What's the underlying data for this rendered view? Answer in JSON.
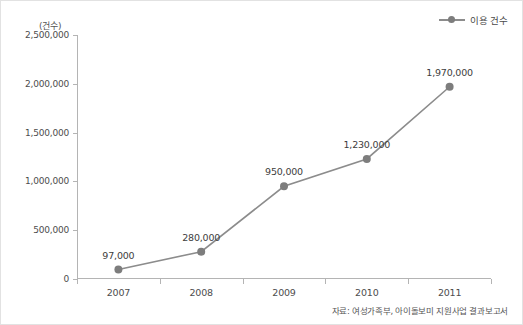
{
  "legend": {
    "label": "이용 건수",
    "symbol_icon": "line-marker-icon",
    "color": "#8c8c8c"
  },
  "axis_unit_caption": "(건수)",
  "source_note": "자료: 여성가족부, 아이돌보미 지원사업 결과보고서",
  "chart_data": {
    "type": "line",
    "title": "",
    "subtitle": "",
    "xlabel": "",
    "ylabel": "(건수)",
    "categories": [
      "2007",
      "2008",
      "2009",
      "2010",
      "2011"
    ],
    "x": [
      2007,
      2008,
      2009,
      2010,
      2011
    ],
    "series": [
      {
        "name": "이용 건수",
        "color": "#8c8c8c",
        "marker": "circle",
        "values": [
          97000,
          280000,
          950000,
          1230000,
          1970000
        ],
        "point_labels": [
          "97,000",
          "280,000",
          "950,000",
          "1,230,000",
          "1,970,000"
        ]
      }
    ],
    "ylim": [
      0,
      2500000
    ],
    "ytick_values": [
      0,
      500000,
      1000000,
      1500000,
      2000000,
      2500000
    ],
    "ytick_labels": [
      "0",
      "500,000",
      "1,000,000",
      "1,500,000",
      "2,000,000",
      "2,500,000"
    ],
    "xtick_labels": [
      "2007",
      "2008",
      "2009",
      "2010",
      "2011"
    ],
    "grid": false,
    "legend_position": "top-right",
    "annotations": [
      "자료: 여성가족부, 아이돌보미 지원사업 결과보고서"
    ]
  }
}
